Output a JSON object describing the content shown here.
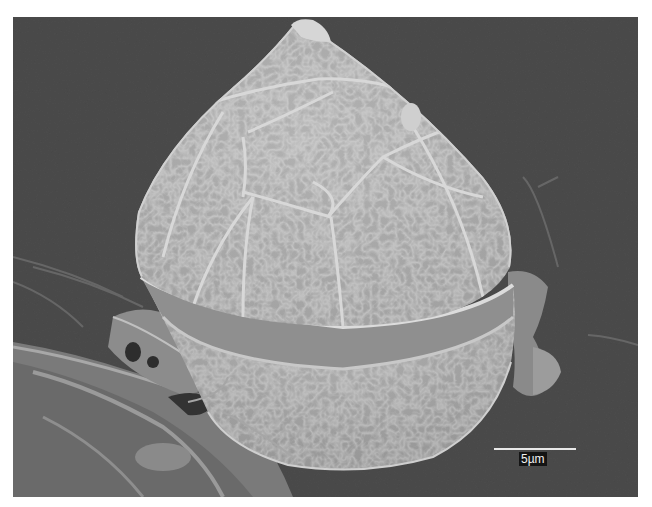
{
  "image": {
    "type": "scanning electron micrograph",
    "subject": "dinoflagellate cell with tabulated theca (conical epitheca, cingulum groove, rounded hypotheca)",
    "background_color": "#4a4a4a",
    "specimen_color": "#b8b8b8"
  },
  "scale_bar": {
    "label": "5µm",
    "color": "#e8e8e8",
    "label_background": "#141414"
  }
}
